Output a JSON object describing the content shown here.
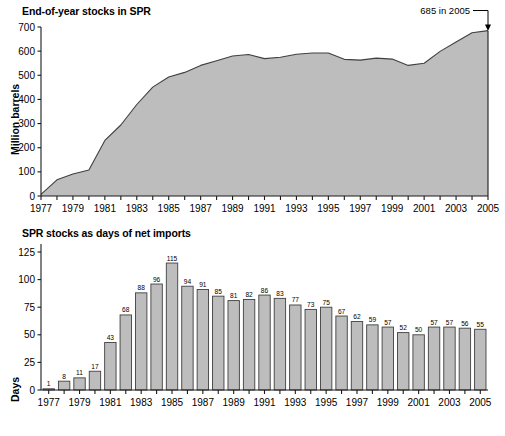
{
  "figure": {
    "background": "#ffffff",
    "fill_color": "#bdbdbd",
    "line_color": "#404040",
    "axis_color": "#1a1a1a"
  },
  "chart_data": [
    {
      "type": "area",
      "title": "End-of-year stocks in SPR",
      "xlabel": "",
      "ylabel": "Million barrels",
      "ylim": [
        0,
        700
      ],
      "yticks": [
        0,
        100,
        200,
        300,
        400,
        500,
        600,
        700
      ],
      "ytick_labels": [
        "0",
        "100",
        "200",
        "300",
        "400",
        "500",
        "600",
        "700"
      ],
      "xlim": [
        1977,
        2005
      ],
      "x": [
        1977,
        1978,
        1979,
        1980,
        1981,
        1982,
        1983,
        1984,
        1985,
        1986,
        1987,
        1988,
        1989,
        1990,
        1991,
        1992,
        1993,
        1994,
        1995,
        1996,
        1997,
        1998,
        1999,
        2000,
        2001,
        2002,
        2003,
        2004,
        2005
      ],
      "values": [
        7,
        67,
        91,
        108,
        230,
        294,
        379,
        451,
        493,
        512,
        541,
        560,
        580,
        586,
        569,
        575,
        587,
        592,
        592,
        566,
        563,
        571,
        567,
        541,
        550,
        599,
        638,
        676,
        685
      ],
      "xtick_labels": [
        "1977",
        "1979",
        "1981",
        "1983",
        "1985",
        "1987",
        "1989",
        "1991",
        "1993",
        "1995",
        "1997",
        "1999",
        "2001",
        "2003",
        "2005"
      ],
      "xticks_all_years": true,
      "grid": false,
      "legend": "none",
      "annotations": [
        {
          "text": "685 in 2005",
          "target_year": 2005,
          "target_value": 685
        }
      ]
    },
    {
      "type": "bar",
      "title": "SPR stocks as days of net imports",
      "xlabel": "",
      "ylabel": "Days",
      "ylim": [
        0,
        125
      ],
      "yticks": [
        0,
        25,
        50,
        75,
        100,
        125
      ],
      "ytick_labels": [
        "0",
        "25",
        "50",
        "75",
        "100",
        "125"
      ],
      "categories": [
        "1977",
        "1978",
        "1979",
        "1980",
        "1981",
        "1982",
        "1983",
        "1984",
        "1985",
        "1986",
        "1987",
        "1988",
        "1989",
        "1990",
        "1991",
        "1992",
        "1993",
        "1994",
        "1995",
        "1996",
        "1997",
        "1998",
        "1999",
        "2000",
        "2001",
        "2002",
        "2003",
        "2004",
        "2005"
      ],
      "values": [
        1,
        8,
        11,
        17,
        43,
        68,
        88,
        96,
        115,
        94,
        91,
        85,
        81,
        82,
        86,
        83,
        77,
        73,
        75,
        67,
        62,
        59,
        57,
        52,
        50,
        57,
        57,
        56,
        55
      ],
      "data_labels": [
        "1",
        "8",
        "11",
        "17",
        "43",
        "68",
        "88",
        "96",
        "115",
        "94",
        "91",
        "85",
        "81",
        "82",
        "86",
        "83",
        "77",
        "73",
        "75",
        "67",
        "62",
        "59",
        "57",
        "52",
        "50",
        "57",
        "57",
        "56",
        "55"
      ],
      "xtick_labels": [
        "1977",
        "1979",
        "1981",
        "1983",
        "1985",
        "1987",
        "1989",
        "1991",
        "1993",
        "1995",
        "1997",
        "1999",
        "2001",
        "2003",
        "2005"
      ],
      "grid": false,
      "legend": "none"
    }
  ]
}
